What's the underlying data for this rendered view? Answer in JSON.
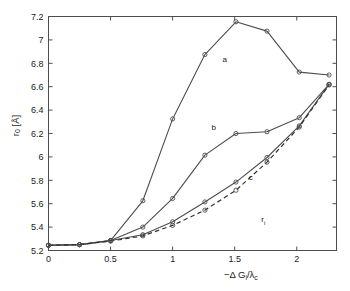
{
  "figure": {
    "background": "#ffffff",
    "axis_color": "#4d4d4d",
    "line_color": "#4d4d4d"
  },
  "axes": {
    "x": {
      "label_parts": {
        "minus": "−",
        "delta": "Δ",
        "g": " G",
        "g_sub": "i",
        "slash": "/",
        "lambda": "λ",
        "lambda_sub": "c"
      },
      "label_plain": "−Δ Gᵢ/λᶜ",
      "min": 0,
      "max": 2.32,
      "ticks": [
        0,
        0.5,
        1,
        1.5,
        2
      ],
      "tick_labels": [
        "0",
        "0.5",
        "1",
        "1.5",
        "2"
      ]
    },
    "y": {
      "label_parts": {
        "r": "r",
        "r_sub": "0",
        "unit": " [Å]"
      },
      "label_plain": "r₀ [Å]",
      "min": 5.2,
      "max": 7.2,
      "ticks": [
        5.2,
        5.4,
        5.6,
        5.8,
        6.0,
        6.2,
        6.4,
        6.6,
        6.8,
        7.0,
        7.2
      ],
      "tick_labels": [
        "5.2",
        "5.4",
        "5.6",
        "5.8",
        "6",
        "6.2",
        "6.4",
        "6.6",
        "6.8",
        "7",
        "7.2"
      ]
    }
  },
  "annotations": [
    {
      "text": "a",
      "x": 1.42,
      "y": 6.81
    },
    {
      "text": "b",
      "x": 1.33,
      "y": 6.23
    },
    {
      "text": "c",
      "x": 1.63,
      "y": 5.8
    },
    {
      "text": "r",
      "sub": "i",
      "x": 1.73,
      "y": 5.44
    }
  ],
  "chart_data": {
    "type": "line",
    "title": "",
    "xlabel": "−Δ Gᵢ/λᶜ",
    "ylabel": "r₀ [Å]",
    "xlim": [
      0,
      2.32
    ],
    "ylim": [
      5.2,
      7.2
    ],
    "grid": false,
    "legend": "inline-curve-labels",
    "series": [
      {
        "name": "a",
        "style": "solid",
        "marker": "circle",
        "x": [
          0.0,
          0.25,
          0.5,
          0.76,
          1.0,
          1.26,
          1.51,
          1.76,
          2.02,
          2.26
        ],
        "y": [
          5.245,
          5.25,
          5.285,
          5.625,
          6.325,
          6.875,
          7.155,
          7.075,
          6.725,
          6.7
        ]
      },
      {
        "name": "b",
        "style": "solid",
        "marker": "circle",
        "x": [
          0.0,
          0.25,
          0.5,
          0.76,
          1.0,
          1.26,
          1.51,
          1.76,
          2.02,
          2.26
        ],
        "y": [
          5.245,
          5.25,
          5.285,
          5.4,
          5.645,
          6.015,
          6.2,
          6.215,
          6.335,
          6.62
        ]
      },
      {
        "name": "c",
        "style": "solid",
        "marker": "circle",
        "x": [
          0.0,
          0.25,
          0.5,
          0.76,
          1.0,
          1.26,
          1.51,
          1.76,
          2.02,
          2.26
        ],
        "y": [
          5.245,
          5.25,
          5.285,
          5.335,
          5.445,
          5.615,
          5.785,
          5.995,
          6.265,
          6.62
        ]
      },
      {
        "name": "r_i",
        "style": "dashed",
        "marker": "circle",
        "x": [
          0.0,
          0.25,
          0.5,
          0.76,
          1.0,
          1.26,
          1.51,
          1.76,
          2.02,
          2.26
        ],
        "y": [
          5.245,
          5.25,
          5.28,
          5.325,
          5.415,
          5.545,
          5.715,
          5.955,
          6.255,
          6.615
        ]
      }
    ]
  }
}
